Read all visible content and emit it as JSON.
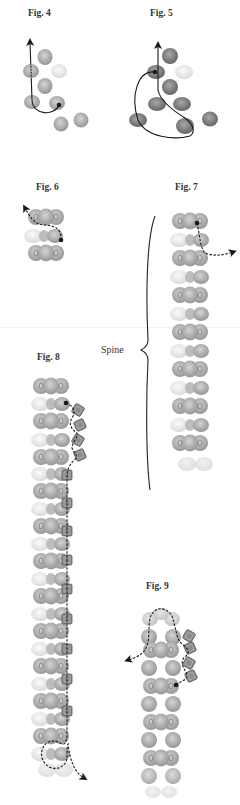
{
  "figures": {
    "fig4": {
      "label": "Fig. 4"
    },
    "fig5": {
      "label": "Fig. 5"
    },
    "fig6": {
      "label": "Fig. 6"
    },
    "fig7": {
      "label": "Fig. 7",
      "annotation": "Spine"
    },
    "fig8": {
      "label": "Fig. 8"
    },
    "fig9": {
      "label": "Fig. 9"
    }
  },
  "colors": {
    "bead_gray": "#a9a9a9",
    "bead_dark": "#7a7a7a",
    "bead_light": "#e6e6e6",
    "thread": "#1a1a1a",
    "square_bead": "#8a8a8a"
  }
}
